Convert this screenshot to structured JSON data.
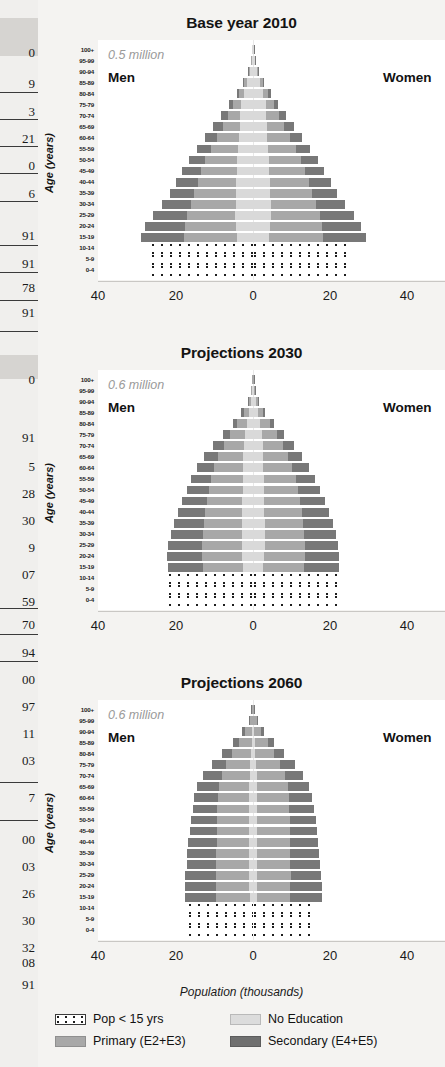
{
  "page": {
    "background_color": "#f2f1ef",
    "plot_background": "#ffffff"
  },
  "bleed_table": {
    "description": "partial numeric column bleeding in from adjacent page",
    "cells": [
      "0",
      "9",
      "3",
      "21",
      "0",
      "6",
      "91",
      "91",
      "78",
      "91",
      "0",
      "91",
      "5",
      "28",
      "30",
      "9",
      "07",
      "59",
      "70",
      "94",
      "00",
      "97",
      "11",
      "03",
      "7",
      "00",
      "03",
      "26",
      "30",
      "32",
      "08",
      "91"
    ]
  },
  "axis": {
    "y_title": "Age (years)",
    "x_title": "Population (thousands)",
    "x_ticks": [
      "40",
      "20",
      "0",
      "20",
      "40"
    ],
    "x_tick_values": [
      -40,
      -20,
      0,
      20,
      40
    ],
    "xlim": [
      -45,
      45
    ],
    "age_groups": [
      "100+",
      "95-99",
      "90-94",
      "85-89",
      "80-84",
      "75-79",
      "70-74",
      "65-69",
      "60-64",
      "55-59",
      "50-54",
      "45-49",
      "40-44",
      "35-39",
      "30-34",
      "25-29",
      "20-24",
      "15-19",
      "10-14",
      "5-9",
      "0-4"
    ]
  },
  "legend": {
    "colors": {
      "kids": "#ffffff",
      "no_education": "#d9d9d9",
      "primary": "#a8a8a8",
      "secondary": "#787878"
    },
    "items": [
      {
        "key": "kids",
        "label": "Pop < 15 yrs"
      },
      {
        "key": "no_education",
        "label": "No Education"
      },
      {
        "key": "primary",
        "label": "Primary (E2+E3)"
      },
      {
        "key": "secondary",
        "label": "Secondary (E4+E5)"
      }
    ]
  },
  "chart_data": [
    {
      "type": "bar",
      "subtype": "population-pyramid-stacked",
      "title": "Base year 2010",
      "annotation": "0.5 million",
      "left_label": "Men",
      "right_label": "Women",
      "xlabel": "Population (thousands)",
      "ylabel": "Age (years)",
      "xlim": [
        -45,
        45
      ],
      "grid": false,
      "categories": [
        "100+",
        "95-99",
        "90-94",
        "85-89",
        "80-84",
        "75-79",
        "70-74",
        "65-69",
        "60-64",
        "55-59",
        "50-54",
        "45-49",
        "40-44",
        "35-39",
        "30-34",
        "25-29",
        "20-24",
        "15-19",
        "10-14",
        "5-9",
        "0-4"
      ],
      "series": [
        {
          "name": "Men no_education",
          "side": "left",
          "stack_order": 1,
          "values": [
            0.15,
            0.4,
            0.9,
            1.6,
            2.4,
            3.2,
            3.5,
            3.6,
            3.8,
            4.0,
            4.2,
            4.3,
            4.5,
            4.6,
            4.7,
            4.8,
            4.6,
            4.3,
            0,
            0,
            0
          ]
        },
        {
          "name": "Men primary",
          "side": "left",
          "stack_order": 2,
          "values": [
            0.03,
            0.1,
            0.3,
            0.7,
            1.3,
            2.1,
            3.2,
            4.6,
            6.0,
            7.4,
            8.6,
            9.6,
            10.4,
            11.2,
            12.0,
            13.0,
            13.8,
            14.4,
            0,
            0,
            0
          ]
        },
        {
          "name": "Men secondary",
          "side": "left",
          "stack_order": 3,
          "values": [
            0.01,
            0.03,
            0.1,
            0.3,
            0.7,
            1.2,
            1.9,
            2.6,
            3.2,
            3.8,
            4.4,
            5.1,
            5.8,
            6.6,
            7.8,
            9.2,
            10.6,
            11.5,
            0,
            0,
            0
          ]
        },
        {
          "name": "Women no_education",
          "side": "right",
          "stack_order": 1,
          "values": [
            0.2,
            0.5,
            1.1,
            1.9,
            2.7,
            3.4,
            3.6,
            3.7,
            3.9,
            4.1,
            4.3,
            4.4,
            4.6,
            4.7,
            4.8,
            4.9,
            4.7,
            4.4,
            0,
            0,
            0
          ]
        },
        {
          "name": "Women primary",
          "side": "right",
          "stack_order": 2,
          "values": [
            0.03,
            0.12,
            0.35,
            0.8,
            1.4,
            2.2,
            3.3,
            4.7,
            6.1,
            7.5,
            8.7,
            9.7,
            10.5,
            11.3,
            12.1,
            13.1,
            13.9,
            14.5,
            0,
            0,
            0
          ]
        },
        {
          "name": "Women secondary",
          "side": "right",
          "stack_order": 3,
          "values": [
            0.01,
            0.03,
            0.1,
            0.3,
            0.7,
            1.2,
            1.9,
            2.6,
            3.2,
            3.8,
            4.4,
            5.1,
            5.8,
            6.6,
            7.8,
            9.2,
            10.6,
            11.6,
            0,
            0,
            0
          ]
        },
        {
          "name": "Men under 15",
          "side": "left",
          "stack_order": 0,
          "values": [
            0,
            0,
            0,
            0,
            0,
            0,
            0,
            0,
            0,
            0,
            0,
            0,
            0,
            0,
            0,
            0,
            0,
            0,
            27.5,
            27.5,
            27.5
          ]
        },
        {
          "name": "Women under 15",
          "side": "right",
          "stack_order": 0,
          "values": [
            0,
            0,
            0,
            0,
            0,
            0,
            0,
            0,
            0,
            0,
            0,
            0,
            0,
            0,
            0,
            0,
            0,
            0,
            26.5,
            26.5,
            26.5
          ]
        }
      ]
    },
    {
      "type": "bar",
      "subtype": "population-pyramid-stacked",
      "title": "Projections 2030",
      "annotation": "0.6 million",
      "left_label": "Men",
      "right_label": "Women",
      "xlabel": "Population (thousands)",
      "ylabel": "Age (years)",
      "xlim": [
        -45,
        45
      ],
      "grid": false,
      "categories": [
        "100+",
        "95-99",
        "90-94",
        "85-89",
        "80-84",
        "75-79",
        "70-74",
        "65-69",
        "60-64",
        "55-59",
        "50-54",
        "45-49",
        "40-44",
        "35-39",
        "30-34",
        "25-29",
        "20-24",
        "15-19",
        "10-14",
        "5-9",
        "0-4"
      ],
      "series": [
        {
          "name": "Men no_education",
          "side": "left",
          "stack_order": 1,
          "values": [
            0.1,
            0.25,
            0.6,
            1.1,
            1.7,
            2.2,
            2.5,
            2.6,
            2.7,
            2.8,
            2.8,
            2.9,
            2.9,
            3.0,
            3.0,
            3.0,
            2.9,
            2.7,
            0,
            0,
            0
          ]
        },
        {
          "name": "Men primary",
          "side": "left",
          "stack_order": 2,
          "values": [
            0.05,
            0.2,
            0.6,
            1.4,
            2.6,
            4.0,
            5.4,
            6.7,
            7.7,
            8.5,
            9.1,
            9.6,
            10.0,
            10.3,
            10.6,
            10.8,
            10.9,
            10.9,
            0,
            0,
            0
          ]
        },
        {
          "name": "Men secondary",
          "side": "left",
          "stack_order": 3,
          "values": [
            0.02,
            0.08,
            0.25,
            0.6,
            1.2,
            2.0,
            2.9,
            3.8,
            4.6,
            5.3,
            6.0,
            6.7,
            7.4,
            8.1,
            8.6,
            9.0,
            9.3,
            9.4,
            0,
            0,
            0
          ]
        },
        {
          "name": "Women no_education",
          "side": "right",
          "stack_order": 1,
          "values": [
            0.12,
            0.3,
            0.7,
            1.3,
            1.9,
            2.4,
            2.6,
            2.7,
            2.8,
            2.9,
            2.9,
            3.0,
            3.0,
            3.1,
            3.1,
            3.1,
            3.0,
            2.8,
            0,
            0,
            0
          ]
        },
        {
          "name": "Women primary",
          "side": "right",
          "stack_order": 2,
          "values": [
            0.05,
            0.2,
            0.6,
            1.4,
            2.6,
            4.0,
            5.5,
            6.8,
            7.8,
            8.6,
            9.2,
            9.7,
            10.1,
            10.4,
            10.7,
            10.9,
            11.0,
            11.0,
            0,
            0,
            0
          ]
        },
        {
          "name": "Women secondary",
          "side": "right",
          "stack_order": 3,
          "values": [
            0.02,
            0.08,
            0.25,
            0.6,
            1.2,
            2.0,
            2.9,
            3.8,
            4.6,
            5.3,
            6.0,
            6.7,
            7.4,
            8.1,
            8.6,
            9.0,
            9.3,
            9.5,
            0,
            0,
            0
          ]
        },
        {
          "name": "Men under 15",
          "side": "left",
          "stack_order": 0,
          "values": [
            0,
            0,
            0,
            0,
            0,
            0,
            0,
            0,
            0,
            0,
            0,
            0,
            0,
            0,
            0,
            0,
            0,
            0,
            23.0,
            23.0,
            23.0
          ]
        },
        {
          "name": "Women under 15",
          "side": "right",
          "stack_order": 0,
          "values": [
            0,
            0,
            0,
            0,
            0,
            0,
            0,
            0,
            0,
            0,
            0,
            0,
            0,
            0,
            0,
            0,
            0,
            0,
            22.5,
            22.5,
            22.5
          ]
        }
      ]
    },
    {
      "type": "bar",
      "subtype": "population-pyramid-stacked",
      "title": "Projections 2060",
      "annotation": "0.6 million",
      "left_label": "Men",
      "right_label": "Women",
      "xlabel": "Population (thousands)",
      "ylabel": "Age (years)",
      "xlim": [
        -45,
        45
      ],
      "grid": false,
      "categories": [
        "100+",
        "95-99",
        "90-94",
        "85-89",
        "80-84",
        "75-79",
        "70-74",
        "65-69",
        "60-64",
        "55-59",
        "50-54",
        "45-49",
        "40-44",
        "35-39",
        "30-34",
        "25-29",
        "20-24",
        "15-19",
        "10-14",
        "5-9",
        "0-4"
      ],
      "series": [
        {
          "name": "Men no_education",
          "side": "left",
          "stack_order": 1,
          "values": [
            0.05,
            0.1,
            0.2,
            0.4,
            0.6,
            0.8,
            0.9,
            1.0,
            1.0,
            1.0,
            1.0,
            1.0,
            1.0,
            1.0,
            1.0,
            1.0,
            1.0,
            0.9,
            0,
            0,
            0
          ]
        },
        {
          "name": "Men primary",
          "side": "left",
          "stack_order": 2,
          "values": [
            0.3,
            0.8,
            1.9,
            3.4,
            5.0,
            6.4,
            7.5,
            8.2,
            8.5,
            8.6,
            8.7,
            8.8,
            8.8,
            8.9,
            8.9,
            9.0,
            9.0,
            9.0,
            0,
            0,
            0
          ]
        },
        {
          "name": "Men secondary",
          "side": "left",
          "stack_order": 3,
          "values": [
            0.1,
            0.3,
            0.8,
            1.6,
            2.7,
            3.9,
            5.0,
            5.8,
            6.3,
            6.7,
            7.0,
            7.3,
            7.6,
            7.8,
            8.0,
            8.2,
            8.4,
            8.5,
            0,
            0,
            0
          ]
        },
        {
          "name": "Women no_education",
          "side": "right",
          "stack_order": 1,
          "values": [
            0.06,
            0.12,
            0.25,
            0.45,
            0.65,
            0.85,
            0.95,
            1.0,
            1.05,
            1.05,
            1.05,
            1.05,
            1.05,
            1.05,
            1.05,
            1.05,
            1.0,
            0.95,
            0,
            0,
            0
          ]
        },
        {
          "name": "Women primary",
          "side": "right",
          "stack_order": 2,
          "values": [
            0.3,
            0.9,
            2.0,
            3.5,
            5.1,
            6.5,
            7.6,
            8.3,
            8.6,
            8.7,
            8.8,
            8.9,
            8.9,
            9.0,
            9.0,
            9.1,
            9.1,
            9.1,
            0,
            0,
            0
          ]
        },
        {
          "name": "Women secondary",
          "side": "right",
          "stack_order": 3,
          "values": [
            0.1,
            0.3,
            0.8,
            1.6,
            2.7,
            3.9,
            5.0,
            5.8,
            6.3,
            6.7,
            7.0,
            7.3,
            7.6,
            7.8,
            8.0,
            8.2,
            8.4,
            8.6,
            0,
            0,
            0
          ]
        },
        {
          "name": "Men under 15",
          "side": "left",
          "stack_order": 0,
          "values": [
            0,
            0,
            0,
            0,
            0,
            0,
            0,
            0,
            0,
            0,
            0,
            0,
            0,
            0,
            0,
            0,
            0,
            0,
            17.5,
            17.5,
            17.5
          ]
        },
        {
          "name": "Women under 15",
          "side": "right",
          "stack_order": 0,
          "values": [
            0,
            0,
            0,
            0,
            0,
            0,
            0,
            0,
            0,
            0,
            0,
            0,
            0,
            0,
            0,
            0,
            0,
            0,
            17.0,
            17.0,
            17.0
          ]
        }
      ]
    }
  ]
}
